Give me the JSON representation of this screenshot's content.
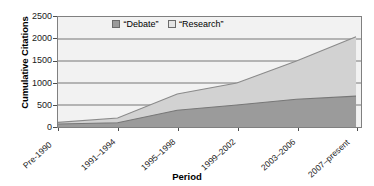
{
  "chart_data": {
    "type": "area",
    "stacked": true,
    "title": "",
    "xlabel": "Period",
    "ylabel": "Cumulative Citations",
    "categories": [
      "Pre-1990",
      "1991–1994",
      "1995–1998",
      "1999–2002",
      "2003–2006",
      "2007–present"
    ],
    "series": [
      {
        "name": "“Debate”",
        "color": "#9b9b9b",
        "values": [
          70,
          95,
          380,
          500,
          630,
          700
        ]
      },
      {
        "name": "“Research”",
        "color": "#d2d2d2",
        "values": [
          35,
          110,
          370,
          500,
          870,
          1350
        ]
      }
    ],
    "totals": [
      105,
      205,
      750,
      1000,
      1500,
      2050
    ],
    "ylim": [
      0,
      2500
    ],
    "yticks": [
      0,
      500,
      1000,
      1500,
      2000,
      2500
    ],
    "ytick_labels": [
      "0",
      "500",
      "1000",
      "1500",
      "2000",
      "2500"
    ],
    "grid": true,
    "grid_color": "#666666",
    "plot_background": "#f2f2f2",
    "legend_position": "top-center"
  },
  "legend": {
    "items": [
      {
        "label": "“Debate”",
        "color": "#9b9b9b"
      },
      {
        "label": "“Research”",
        "color": "#d2d2d2"
      }
    ]
  },
  "axes": {
    "y_title": "Cumulative Citations",
    "x_title": "Period"
  }
}
